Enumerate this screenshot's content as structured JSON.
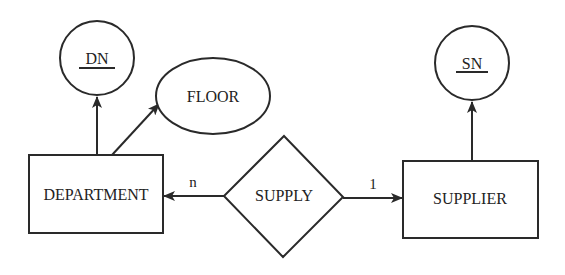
{
  "diagram": {
    "type": "entity-relationship",
    "entities": [
      {
        "id": "department",
        "label": "DEPARTMENT"
      },
      {
        "id": "supplier",
        "label": "SUPPLIER"
      }
    ],
    "relationships": [
      {
        "id": "supply",
        "label": "SUPPLY"
      }
    ],
    "attributes": [
      {
        "id": "dn",
        "label": "DN",
        "key": true,
        "owner": "department"
      },
      {
        "id": "floor",
        "label": "FLOOR",
        "key": false,
        "owner": "department"
      },
      {
        "id": "sn",
        "label": "SN",
        "key": true,
        "owner": "supplier"
      }
    ],
    "edges": [
      {
        "from": "supply",
        "to": "department",
        "cardinality": "n"
      },
      {
        "from": "supply",
        "to": "supplier",
        "cardinality": "1"
      },
      {
        "from": "department",
        "to": "dn"
      },
      {
        "from": "department",
        "to": "floor"
      },
      {
        "from": "supplier",
        "to": "sn"
      }
    ]
  }
}
